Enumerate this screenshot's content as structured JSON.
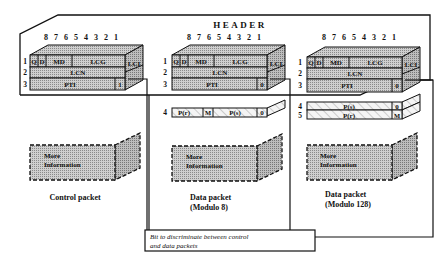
{
  "header_label": "HEADER",
  "bit_numbers": "8 7 6 5 4 3 2 1",
  "colors": {
    "ink": "#111111",
    "fill_front": "#bdbdbd",
    "fill_top": "#cfcfcf",
    "fill_side": "#a9a9a9",
    "hatch": "#c8c8c8"
  },
  "packets": [
    {
      "id": "control",
      "title_line1": "Control packet",
      "title_line2": "",
      "rows": {
        "r1_num": "1",
        "r2_num": "2",
        "r3_num": "3",
        "q": "Q",
        "d": "D",
        "md": "MD",
        "lcg": "LCG",
        "lci": "LCI",
        "lcn": "LCN",
        "pti": "PTI",
        "bit": "1"
      },
      "more_line1": "More",
      "more_line2": "Information"
    },
    {
      "id": "data-mod8",
      "title_line1": "Data packet",
      "title_line2": "(Modulo 8)",
      "rows": {
        "r1_num": "1",
        "r2_num": "2",
        "r3_num": "3",
        "q": "Q",
        "d": "D",
        "md": "MD",
        "lcg": "LCG",
        "lci": "LCI",
        "lcn": "LCN",
        "pti": "PTI",
        "bit": "0"
      },
      "extra": {
        "r4_num": "4",
        "pr": "P(r)",
        "m": "M",
        "ps": "P(s)",
        "bit": "0"
      },
      "more_line1": "More",
      "more_line2": "Information"
    },
    {
      "id": "data-mod128",
      "title_line1": "Data packet",
      "title_line2": "(Modulo 128)",
      "rows": {
        "r1_num": "1",
        "r2_num": "2",
        "r3_num": "3",
        "q": "Q",
        "d": "D",
        "md": "MD",
        "lcg": "LCG",
        "lci": "LCI",
        "lcn": "LCN",
        "pti": "PTI",
        "bit": "0"
      },
      "extra": {
        "r4_num": "4",
        "ps": "P(s)",
        "bit4": "0",
        "r5_num": "5",
        "pr": "P(r)",
        "m": "M"
      },
      "more_line1": "More",
      "more_line2": "Information"
    }
  ],
  "caption_line1": "Bit  to discriminate between control",
  "caption_line2": "and data packets"
}
